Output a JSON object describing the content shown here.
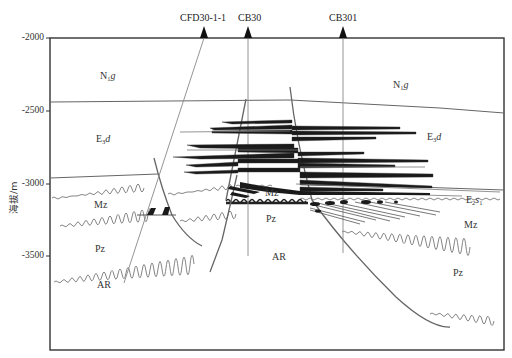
{
  "diagram": {
    "type": "geological-cross-section",
    "y_axis": {
      "label": "海拔/m",
      "ticks": [
        "-2000",
        "-2500",
        "-3000",
        "-3500"
      ]
    },
    "wells": [
      {
        "name": "CFD30-1-1"
      },
      {
        "name": "CB30"
      },
      {
        "name": "CB301"
      }
    ],
    "formations": {
      "n1g_left": {
        "main": "N",
        "sub": "1",
        "ital": "g"
      },
      "n1g_right": {
        "main": "N",
        "sub": "1",
        "ital": "g"
      },
      "e3d_left": {
        "main": "E",
        "sub": "3",
        "ital": "d"
      },
      "e3d_right": {
        "main": "E",
        "sub": "3",
        "ital": "d"
      },
      "e2s1": {
        "main": "E",
        "sub": "2",
        "ital": "s",
        "sub2": "1"
      },
      "mz_left": "Mz",
      "mz_center": "Mz",
      "mz_right": "Mz",
      "pz_left": "Pz",
      "pz_center": "Pz",
      "pz_right": "Pz",
      "ar_left": "AR",
      "ar_center": "AR"
    },
    "colors": {
      "frame": "#333333",
      "lines": "#555555",
      "sand": "#1a1a1a",
      "text": "#333333"
    }
  }
}
